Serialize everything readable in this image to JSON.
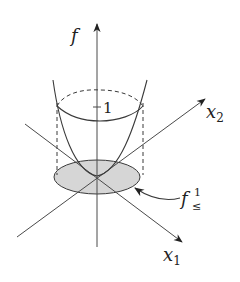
{
  "figure": {
    "type": "3d-function-sublevel-set-diagram",
    "labels": {
      "f_axis": "f",
      "x1_axis": "x",
      "x1_sub": "1",
      "x2_axis": "x",
      "x2_sub": "2",
      "level_value": "1",
      "sublevel_base": "f",
      "sublevel_sup": "1",
      "sublevel_sub": "≤"
    },
    "colors": {
      "line": "#3a3a3a",
      "shaded_region": "#d6d6d6",
      "background": "#ffffff"
    }
  }
}
